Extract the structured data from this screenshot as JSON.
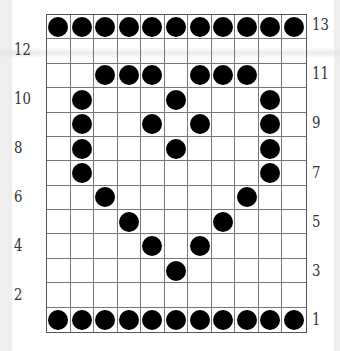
{
  "diagram": {
    "title": "",
    "grid": {
      "rows": 13,
      "cols": 11,
      "filled_cells": {
        "13": [
          1,
          2,
          3,
          4,
          5,
          6,
          7,
          8,
          9,
          10,
          11
        ],
        "12": [],
        "11": [
          3,
          4,
          5,
          7,
          8,
          9
        ],
        "10": [
          2,
          6,
          10
        ],
        "9": [
          2,
          5,
          7,
          10
        ],
        "8": [
          2,
          6,
          10
        ],
        "7": [
          2,
          10
        ],
        "6": [
          3,
          9
        ],
        "5": [
          4,
          8
        ],
        "4": [
          5,
          7
        ],
        "3": [
          6
        ],
        "2": [],
        "1": [
          1,
          2,
          3,
          4,
          5,
          6,
          7,
          8,
          9,
          10,
          11
        ]
      },
      "dot_color": "#000000",
      "line_color": "#777777"
    },
    "row_labels_left": [
      "12",
      "10",
      "8",
      "6",
      "4",
      "2"
    ],
    "row_labels_right": [
      "13",
      "11",
      "9",
      "7",
      "5",
      "3",
      "1"
    ],
    "shape_depicted": "heart"
  }
}
